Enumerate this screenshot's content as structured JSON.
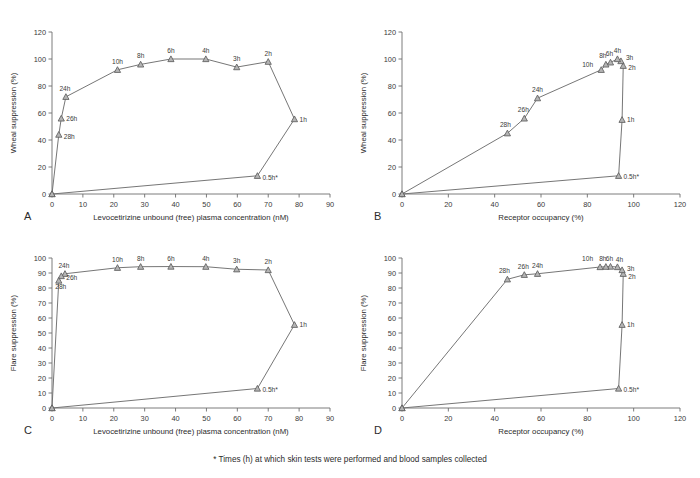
{
  "figure": {
    "footnote": "*  Times (h) at which skin tests were performed and blood samples collected",
    "marker_fill": "#b4b4b4",
    "marker_stroke": "#5f5f5f",
    "line_color": "#6f6f6f",
    "axis_color": "#6d6d6d"
  },
  "chart_data": [
    {
      "type": "line",
      "panel": "A",
      "title": "",
      "xlabel": "Levocetirizine unbound (free) plasma concentration (nM)",
      "ylabel": "Wheal suppression (%)",
      "xlim": [
        0,
        90
      ],
      "ylim": [
        0,
        120
      ],
      "xticks": [
        0,
        10,
        20,
        30,
        40,
        50,
        60,
        70,
        80,
        90
      ],
      "yticks": [
        0,
        20,
        40,
        60,
        80,
        100,
        120
      ],
      "grid": false,
      "legend": "none",
      "series": [
        {
          "name": "Wheal suppression vs unbound plasma concentration (hysteresis loop)",
          "points": [
            {
              "label": "",
              "x": 0.0,
              "y": 0.0,
              "lx": 0,
              "ly": 0
            },
            {
              "label": "0.5h*",
              "x": 66.5,
              "y": 13.5,
              "lx": 5,
              "ly": 4
            },
            {
              "label": "1h",
              "x": 78.5,
              "y": 55.5,
              "lx": 5,
              "ly": 2.5
            },
            {
              "label": "2h",
              "x": 70.0,
              "y": 98.0,
              "lx": 0,
              "ly": -6
            },
            {
              "label": "3h",
              "x": 59.8,
              "y": 94.0,
              "lx": 0,
              "ly": -6
            },
            {
              "label": "4h",
              "x": 49.8,
              "y": 100.0,
              "lx": 0,
              "ly": -6
            },
            {
              "label": "6h",
              "x": 38.5,
              "y": 100.0,
              "lx": 0,
              "ly": -6
            },
            {
              "label": "8h",
              "x": 28.7,
              "y": 96.0,
              "lx": 0,
              "ly": -6
            },
            {
              "label": "10h",
              "x": 21.2,
              "y": 92.0,
              "lx": 0,
              "ly": -6
            },
            {
              "label": "24h",
              "x": 4.5,
              "y": 72.0,
              "lx": -1,
              "ly": -6
            },
            {
              "label": "26h",
              "x": 3.0,
              "y": 56.0,
              "lx": 5,
              "ly": 2.5
            },
            {
              "label": "28h",
              "x": 2.2,
              "y": 44.0,
              "lx": 5,
              "ly": 4
            },
            {
              "label": "",
              "x": 0.0,
              "y": 0.0,
              "lx": 0,
              "ly": 0
            }
          ]
        }
      ]
    },
    {
      "type": "line",
      "panel": "B",
      "title": "",
      "xlabel": "Receptor occupancy (%)",
      "ylabel": "Wheal suppression (%)",
      "xlim": [
        0,
        120
      ],
      "ylim": [
        0,
        120
      ],
      "xticks": [
        0,
        20,
        40,
        60,
        80,
        100,
        120
      ],
      "yticks": [
        0,
        20,
        40,
        60,
        80,
        100,
        120
      ],
      "grid": false,
      "legend": "none",
      "series": [
        {
          "name": "Wheal suppression vs receptor occupancy (hysteresis loop)",
          "points": [
            {
              "label": "",
              "x": 0.0,
              "y": 0.0,
              "lx": 0,
              "ly": 0
            },
            {
              "label": "0.5h*",
              "x": 93.5,
              "y": 13.5,
              "lx": 5,
              "ly": 3
            },
            {
              "label": "1h",
              "x": 95.0,
              "y": 55.0,
              "lx": 5,
              "ly": 2.5
            },
            {
              "label": "2h",
              "x": 95.5,
              "y": 95.0,
              "lx": 5,
              "ly": 4
            },
            {
              "label": "3h",
              "x": 94.5,
              "y": 98.5,
              "lx": 5,
              "ly": -1
            },
            {
              "label": "4h",
              "x": 93.0,
              "y": 100.0,
              "lx": 0,
              "ly": -6
            },
            {
              "label": "6h",
              "x": 90.0,
              "y": 97.5,
              "lx": -1,
              "ly": -6
            },
            {
              "label": "8h",
              "x": 88.0,
              "y": 96.0,
              "lx": -3,
              "ly": -6
            },
            {
              "label": "10h",
              "x": 86.0,
              "y": 92.0,
              "lx": -8,
              "ly": -3
            },
            {
              "label": "24h",
              "x": 58.5,
              "y": 71.0,
              "lx": 0,
              "ly": -6
            },
            {
              "label": "26h",
              "x": 52.8,
              "y": 56.0,
              "lx": -1,
              "ly": -6
            },
            {
              "label": "28h",
              "x": 45.5,
              "y": 45.0,
              "lx": -2,
              "ly": -6
            },
            {
              "label": "",
              "x": 0.0,
              "y": 0.0,
              "lx": 0,
              "ly": 0
            }
          ]
        }
      ]
    },
    {
      "type": "line",
      "panel": "C",
      "title": "",
      "xlabel": "Levocetirizine unbound (free) plasma concentration (nM)",
      "ylabel": "Flare suppression (%)",
      "xlim": [
        0,
        90
      ],
      "ylim": [
        0,
        100
      ],
      "xticks": [
        0,
        10,
        20,
        30,
        40,
        50,
        60,
        70,
        80,
        90
      ],
      "yticks": [
        0,
        10,
        20,
        30,
        40,
        50,
        60,
        70,
        80,
        90,
        100
      ],
      "grid": false,
      "legend": "none",
      "series": [
        {
          "name": "Flare suppression vs unbound plasma concentration (hysteresis loop)",
          "points": [
            {
              "label": "",
              "x": 0.0,
              "y": 0.0,
              "lx": 0,
              "ly": 0
            },
            {
              "label": "0.5h*",
              "x": 66.5,
              "y": 13.0,
              "lx": 5,
              "ly": 3
            },
            {
              "label": "1h",
              "x": 78.5,
              "y": 55.5,
              "lx": 5,
              "ly": 2.5
            },
            {
              "label": "2h",
              "x": 70.0,
              "y": 92.0,
              "lx": 0,
              "ly": -6
            },
            {
              "label": "3h",
              "x": 59.8,
              "y": 92.5,
              "lx": 0,
              "ly": -6
            },
            {
              "label": "4h",
              "x": 49.8,
              "y": 94.2,
              "lx": 0,
              "ly": -6
            },
            {
              "label": "6h",
              "x": 38.5,
              "y": 94.3,
              "lx": 0,
              "ly": -6
            },
            {
              "label": "8h",
              "x": 28.7,
              "y": 94.2,
              "lx": 0,
              "ly": -6
            },
            {
              "label": "10h",
              "x": 21.2,
              "y": 93.5,
              "lx": 0,
              "ly": -6
            },
            {
              "label": "24h",
              "x": 4.2,
              "y": 89.5,
              "lx": -1,
              "ly": -6
            },
            {
              "label": "26h",
              "x": 3.0,
              "y": 88.0,
              "lx": 5,
              "ly": 4
            },
            {
              "label": "28h",
              "x": 2.2,
              "y": 85.0,
              "lx": 2,
              "ly": 8
            },
            {
              "label": "",
              "x": 0.0,
              "y": 0.0,
              "lx": 0,
              "ly": 0
            }
          ]
        }
      ]
    },
    {
      "type": "line",
      "panel": "D",
      "title": "",
      "xlabel": "Receptor occupancy (%)",
      "ylabel": "Flare suppression (%)",
      "xlim": [
        0,
        120
      ],
      "ylim": [
        0,
        100
      ],
      "xticks": [
        0,
        20,
        40,
        60,
        80,
        100,
        120
      ],
      "yticks": [
        0,
        10,
        20,
        30,
        40,
        50,
        60,
        70,
        80,
        90,
        100
      ],
      "grid": false,
      "legend": "none",
      "series": [
        {
          "name": "Flare suppression vs receptor occupancy (hysteresis loop)",
          "points": [
            {
              "label": "",
              "x": 0.0,
              "y": 0.0,
              "lx": 0,
              "ly": 0
            },
            {
              "label": "0.5h*",
              "x": 93.5,
              "y": 13.0,
              "lx": 5,
              "ly": 3
            },
            {
              "label": "1h",
              "x": 95.0,
              "y": 55.5,
              "lx": 5,
              "ly": 2.5
            },
            {
              "label": "2h",
              "x": 95.5,
              "y": 89.5,
              "lx": 5,
              "ly": 5
            },
            {
              "label": "3h",
              "x": 95.0,
              "y": 92.0,
              "lx": 5,
              "ly": 0.5
            },
            {
              "label": "4h",
              "x": 93.0,
              "y": 94.0,
              "lx": 2,
              "ly": -5
            },
            {
              "label": "6h",
              "x": 90.0,
              "y": 94.3,
              "lx": -1,
              "ly": -6
            },
            {
              "label": "8h",
              "x": 88.0,
              "y": 94.2,
              "lx": -3,
              "ly": -6
            },
            {
              "label": "10h",
              "x": 85.5,
              "y": 94.0,
              "lx": -7,
              "ly": -6
            },
            {
              "label": "24h",
              "x": 58.5,
              "y": 89.5,
              "lx": 0,
              "ly": -6
            },
            {
              "label": "26h",
              "x": 52.8,
              "y": 88.8,
              "lx": -1,
              "ly": -6
            },
            {
              "label": "28h",
              "x": 45.5,
              "y": 85.8,
              "lx": -3,
              "ly": -6
            },
            {
              "label": "",
              "x": 0.0,
              "y": 0.0,
              "lx": 0,
              "ly": 0
            }
          ]
        }
      ]
    }
  ]
}
